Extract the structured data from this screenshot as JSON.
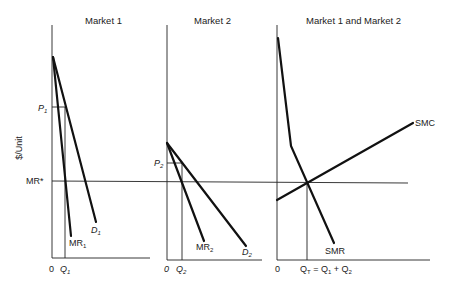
{
  "diagram": {
    "y_axis_label": "$/Unit",
    "shared_line_label": "MR*",
    "panels": [
      {
        "title": "Market 1",
        "origin_label": "0",
        "quantity_label": "Q",
        "quantity_sub": "1",
        "price_label": "P",
        "price_sub": "1",
        "curves": [
          {
            "name": "D",
            "sub": "1"
          },
          {
            "name": "MR",
            "sub": "1"
          }
        ]
      },
      {
        "title": "Market 2",
        "origin_label": "0",
        "quantity_label": "Q",
        "quantity_sub": "2",
        "price_label": "P",
        "price_sub": "2",
        "curves": [
          {
            "name": "D",
            "sub": "2"
          },
          {
            "name": "MR",
            "sub": "2"
          }
        ]
      },
      {
        "title": "Market 1 and Market 2",
        "origin_label": "0",
        "quantity_label": "Q",
        "quantity_sub": "T",
        "quantity_eq": " = Q",
        "quantity_eq_sub1": "1",
        "quantity_plus": " + Q",
        "quantity_eq_sub2": "2",
        "curves": [
          {
            "name": "SMC"
          },
          {
            "name": "SMR"
          }
        ]
      }
    ]
  }
}
